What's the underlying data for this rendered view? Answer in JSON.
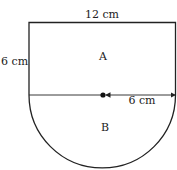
{
  "diagram": {
    "type": "composite-shape",
    "labels": {
      "top_width": "12 cm",
      "left_height": "6 cm",
      "radius": "6 cm",
      "region_a": "A",
      "region_b": "B"
    },
    "shapes": [
      {
        "name": "rectangle",
        "region": "A",
        "width_cm": 12,
        "height_cm": 6
      },
      {
        "name": "semicircle",
        "region": "B",
        "radius_cm": 6
      }
    ],
    "colors": {
      "stroke": "#222222",
      "background": "#ffffff"
    }
  }
}
